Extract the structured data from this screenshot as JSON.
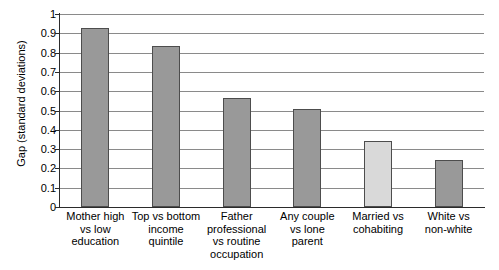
{
  "chart_data": {
    "type": "bar",
    "title": "",
    "subtitle": "",
    "xlabel": "",
    "ylabel": "Gap (standard deviations)",
    "ylim": [
      0,
      1
    ],
    "yticks": [
      "0",
      "0.1",
      "0.2",
      "0.3",
      "0.4",
      "0.5",
      "0.6",
      "0.7",
      "0.8",
      "0.9",
      "1"
    ],
    "ytick_values": [
      0,
      0.1,
      0.2,
      0.3,
      0.4,
      0.5,
      0.6,
      0.7,
      0.8,
      0.9,
      1
    ],
    "grid": true,
    "legend": false,
    "legend_position": "none",
    "categories": [
      "Mother high\nvs low\neducation",
      "Top vs bottom\nincome\nquintile",
      "Father\nprofessional\nvs routine\noccupation",
      "Any couple\nvs lone\nparent",
      "Married vs\ncohabiting",
      "White vs\nnon-white"
    ],
    "values": [
      0.925,
      0.835,
      0.565,
      0.51,
      0.34,
      0.245
    ],
    "bar_colors": [
      "#999999",
      "#999999",
      "#999999",
      "#999999",
      "#d9d9d9",
      "#999999"
    ],
    "bar_edge_color": "#4d4d4d",
    "highlighted_index": 4,
    "gridline_color": "#8a8a8a",
    "axis_color": "#2b2b2b",
    "background": "#ffffff"
  }
}
